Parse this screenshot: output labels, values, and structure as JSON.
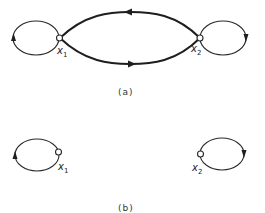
{
  "panels": [
    {
      "id": "a",
      "caption": "(a)",
      "nodes": [
        {
          "name": "x",
          "sub": "1"
        },
        {
          "name": "x",
          "sub": "2"
        }
      ],
      "edges": [
        {
          "from": "x1",
          "to": "x1",
          "type": "self-loop",
          "direction": "counterclockwise"
        },
        {
          "from": "x2",
          "to": "x1",
          "type": "arc-top",
          "weight": "thick"
        },
        {
          "from": "x1",
          "to": "x2",
          "type": "arc-bottom",
          "weight": "thick"
        },
        {
          "from": "x2",
          "to": "x2",
          "type": "self-loop",
          "direction": "clockwise"
        }
      ]
    },
    {
      "id": "b",
      "caption": "(b)",
      "nodes": [
        {
          "name": "x",
          "sub": "1"
        },
        {
          "name": "x",
          "sub": "2"
        }
      ],
      "edges": [
        {
          "from": "x1",
          "to": "x1",
          "type": "self-loop",
          "direction": "counterclockwise"
        },
        {
          "from": "x2",
          "to": "x2",
          "type": "self-loop",
          "direction": "clockwise"
        }
      ]
    }
  ],
  "colors": {
    "stroke": "#1e1e1e",
    "background": "#ffffff"
  }
}
